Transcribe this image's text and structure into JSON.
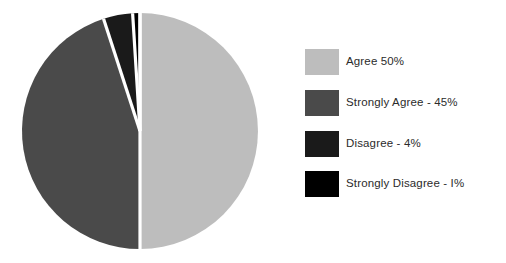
{
  "chart_data": {
    "type": "pie",
    "title": "",
    "subtitle": "",
    "xlabel": "",
    "ylabel": "",
    "grid": false,
    "legend_position": "right",
    "start_angle_deg": 0,
    "direction": "clockwise",
    "units": "%",
    "categories": [
      "Agree",
      "Strongly Agree",
      "Disagree",
      "Strongly Disagree"
    ],
    "values": [
      50,
      45,
      4,
      1
    ],
    "labels": [
      "Agree 50%",
      "Strongly Agree - 45%",
      "Disagree - 4%",
      "Strongly Disagree - I%"
    ],
    "colors": [
      "#bdbdbd",
      "#4a4a4a",
      "#1a1a1a",
      "#000000"
    ],
    "slices": [
      {
        "name": "Agree",
        "value": 50,
        "label": "Agree 50%",
        "color": "#bdbdbd"
      },
      {
        "name": "Strongly Agree",
        "value": 45,
        "label": "Strongly Agree - 45%",
        "color": "#4a4a4a"
      },
      {
        "name": "Disagree",
        "value": 4,
        "label": "Disagree - 4%",
        "color": "#1a1a1a"
      },
      {
        "name": "Strongly Disagree",
        "value": 1,
        "label": "Strongly Disagree - I%",
        "color": "#000000"
      }
    ]
  },
  "pie": {
    "center_x": 140,
    "center_y": 131,
    "radius": 118,
    "separator_color": "#ffffff",
    "separator_width": 3.2
  },
  "legend": {
    "items": [
      {
        "label": "Agree 50%",
        "swatch_color": "#bdbdbd",
        "swatch_name": "legend-swatch-agree"
      },
      {
        "label": "Strongly Agree - 45%",
        "swatch_color": "#4a4a4a",
        "swatch_name": "legend-swatch-strongly-agree"
      },
      {
        "label": "Disagree - 4%",
        "swatch_color": "#1a1a1a",
        "swatch_name": "legend-swatch-disagree"
      },
      {
        "label": "Strongly Disagree - I%",
        "swatch_color": "#000000",
        "swatch_name": "legend-swatch-strongly-disagree"
      }
    ]
  },
  "canvas": {
    "background": "#ffffff",
    "width": 506,
    "height": 263
  }
}
